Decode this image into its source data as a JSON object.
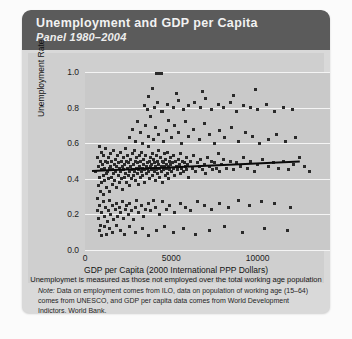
{
  "card": {
    "title": "Unemployment and GDP per Capita",
    "subtitle": "Panel 1980–2004",
    "header_color": "#5b5b5b",
    "panel_color": "#cfcfcf"
  },
  "footnote": {
    "lead": "Note:",
    "text": " Data on employment comes from ILO, data on population of working age (15–64) comes from UNESCO, and GDP per capita data comes from World Development Indictors, World Bank."
  },
  "chart_data": {
    "type": "scatter",
    "title": "Unemployment and GDP per Capita",
    "subtitle": "Panel 1980–2004",
    "xlabel": "GDP per Capita (2000 International  PPP Dollars)",
    "xnote": "Unemploymet is measured as those not employed over the total working age population",
    "ylabel": "Unemployment Rate",
    "xlim": [
      0,
      15000
    ],
    "ylim": [
      0.0,
      1.0
    ],
    "xticks": [
      0,
      5000,
      10000,
      15000
    ],
    "xtick_labels": [
      "0",
      "5000",
      "10000",
      "15000"
    ],
    "yticks": [
      0.0,
      0.2,
      0.4,
      0.6,
      0.8,
      1.0
    ],
    "ytick_labels": [
      "0.0",
      "0.2",
      "0.4",
      "0.6",
      "0.8",
      "1.0"
    ],
    "grid": "horizontal",
    "legend": "none",
    "marker_color": "#2a2a2a",
    "fit_line": {
      "color": "#0b0b0b",
      "x": [
        380,
        12400
      ],
      "y": [
        0.452,
        0.505
      ]
    },
    "points": [
      [
        620,
        0.44
      ],
      [
        700,
        0.29
      ],
      [
        740,
        0.52
      ],
      [
        780,
        0.36
      ],
      [
        800,
        0.47
      ],
      [
        820,
        0.58
      ],
      [
        860,
        0.41
      ],
      [
        880,
        0.33
      ],
      [
        900,
        0.5
      ],
      [
        930,
        0.45
      ],
      [
        960,
        0.38
      ],
      [
        980,
        0.55
      ],
      [
        1010,
        0.48
      ],
      [
        1040,
        0.42
      ],
      [
        1060,
        0.31
      ],
      [
        1090,
        0.53
      ],
      [
        1120,
        0.46
      ],
      [
        1150,
        0.39
      ],
      [
        1180,
        0.5
      ],
      [
        1200,
        0.57
      ],
      [
        1230,
        0.43
      ],
      [
        1260,
        0.35
      ],
      [
        1290,
        0.49
      ],
      [
        1310,
        0.44
      ],
      [
        1340,
        0.52
      ],
      [
        1370,
        0.4
      ],
      [
        1400,
        0.46
      ],
      [
        1430,
        0.33
      ],
      [
        1460,
        0.54
      ],
      [
        1490,
        0.47
      ],
      [
        1520,
        0.41
      ],
      [
        1550,
        0.5
      ],
      [
        1580,
        0.37
      ],
      [
        1610,
        0.45
      ],
      [
        1640,
        0.56
      ],
      [
        1670,
        0.43
      ],
      [
        1700,
        0.48
      ],
      [
        1730,
        0.39
      ],
      [
        1760,
        0.51
      ],
      [
        1790,
        0.44
      ],
      [
        1820,
        0.35
      ],
      [
        1850,
        0.47
      ],
      [
        1880,
        0.53
      ],
      [
        1910,
        0.42
      ],
      [
        1940,
        0.49
      ],
      [
        1970,
        0.38
      ],
      [
        2000,
        0.46
      ],
      [
        2030,
        0.55
      ],
      [
        2060,
        0.44
      ],
      [
        2090,
        0.4
      ],
      [
        2120,
        0.5
      ],
      [
        2150,
        0.47
      ],
      [
        2180,
        0.34
      ],
      [
        2210,
        0.52
      ],
      [
        2240,
        0.45
      ],
      [
        2270,
        0.41
      ],
      [
        2300,
        0.48
      ],
      [
        2330,
        0.57
      ],
      [
        2360,
        0.43
      ],
      [
        2390,
        0.5
      ],
      [
        2420,
        0.38
      ],
      [
        2450,
        0.46
      ],
      [
        2480,
        0.53
      ],
      [
        2510,
        0.42
      ],
      [
        2540,
        0.49
      ],
      [
        2570,
        0.44
      ],
      [
        2600,
        0.36
      ],
      [
        2630,
        0.51
      ],
      [
        2660,
        0.47
      ],
      [
        2690,
        0.4
      ],
      [
        2720,
        0.54
      ],
      [
        2750,
        0.45
      ],
      [
        2780,
        0.48
      ],
      [
        2810,
        0.42
      ],
      [
        2840,
        0.56
      ],
      [
        2870,
        0.44
      ],
      [
        2900,
        0.5
      ],
      [
        2930,
        0.39
      ],
      [
        2960,
        0.46
      ],
      [
        2990,
        0.52
      ],
      [
        3020,
        0.43
      ],
      [
        3050,
        0.49
      ],
      [
        3080,
        0.45
      ],
      [
        3110,
        0.37
      ],
      [
        3140,
        0.53
      ],
      [
        3170,
        0.47
      ],
      [
        3200,
        0.41
      ],
      [
        3230,
        0.5
      ],
      [
        3260,
        0.44
      ],
      [
        3290,
        0.55
      ],
      [
        3320,
        0.46
      ],
      [
        3350,
        0.42
      ],
      [
        3380,
        0.48
      ],
      [
        3410,
        0.51
      ],
      [
        3440,
        0.45
      ],
      [
        3470,
        0.38
      ],
      [
        3500,
        0.53
      ],
      [
        3530,
        0.47
      ],
      [
        3560,
        0.43
      ],
      [
        3590,
        0.49
      ],
      [
        3620,
        0.46
      ],
      [
        3650,
        0.58
      ],
      [
        3680,
        0.44
      ],
      [
        3710,
        0.5
      ],
      [
        3740,
        0.4
      ],
      [
        3770,
        0.47
      ],
      [
        3800,
        0.52
      ],
      [
        3830,
        0.45
      ],
      [
        3860,
        0.48
      ],
      [
        3890,
        0.42
      ],
      [
        3920,
        0.54
      ],
      [
        3950,
        0.46
      ],
      [
        3980,
        0.51
      ],
      [
        4010,
        0.44
      ],
      [
        4040,
        0.49
      ],
      [
        4070,
        0.39
      ],
      [
        4100,
        0.47
      ],
      [
        4130,
        0.53
      ],
      [
        4160,
        0.45
      ],
      [
        4190,
        0.5
      ],
      [
        4220,
        0.43
      ],
      [
        4250,
        0.48
      ],
      [
        4280,
        0.56
      ],
      [
        4310,
        0.46
      ],
      [
        4340,
        0.41
      ],
      [
        4370,
        0.52
      ],
      [
        4400,
        0.47
      ],
      [
        4430,
        0.44
      ],
      [
        4460,
        0.5
      ],
      [
        4490,
        0.38
      ],
      [
        4520,
        0.49
      ],
      [
        4550,
        0.45
      ],
      [
        4580,
        0.54
      ],
      [
        4610,
        0.47
      ],
      [
        4640,
        0.42
      ],
      [
        4670,
        0.51
      ],
      [
        4700,
        0.46
      ],
      [
        4730,
        0.48
      ],
      [
        4760,
        0.43
      ],
      [
        4790,
        0.55
      ],
      [
        4820,
        0.47
      ],
      [
        4850,
        0.4
      ],
      [
        4880,
        0.5
      ],
      [
        4910,
        0.45
      ],
      [
        4940,
        0.52
      ],
      [
        4970,
        0.48
      ],
      [
        5000,
        0.44
      ],
      [
        5050,
        0.49
      ],
      [
        5100,
        0.46
      ],
      [
        5150,
        0.53
      ],
      [
        5200,
        0.42
      ],
      [
        5250,
        0.5
      ],
      [
        5300,
        0.47
      ],
      [
        5350,
        0.45
      ],
      [
        5400,
        0.51
      ],
      [
        5450,
        0.48
      ],
      [
        5500,
        0.43
      ],
      [
        5550,
        0.54
      ],
      [
        5600,
        0.46
      ],
      [
        5650,
        0.5
      ],
      [
        5700,
        0.44
      ],
      [
        5750,
        0.49
      ],
      [
        5800,
        0.47
      ],
      [
        5850,
        0.52
      ],
      [
        5900,
        0.45
      ],
      [
        5950,
        0.48
      ],
      [
        6000,
        0.41
      ],
      [
        6100,
        0.5
      ],
      [
        6200,
        0.46
      ],
      [
        6300,
        0.53
      ],
      [
        6400,
        0.44
      ],
      [
        6500,
        0.49
      ],
      [
        6600,
        0.47
      ],
      [
        6700,
        0.51
      ],
      [
        6800,
        0.45
      ],
      [
        6900,
        0.48
      ],
      [
        7000,
        0.43
      ],
      [
        7100,
        0.52
      ],
      [
        7200,
        0.47
      ],
      [
        7300,
        0.5
      ],
      [
        7400,
        0.45
      ],
      [
        7500,
        0.49
      ],
      [
        7600,
        0.46
      ],
      [
        7700,
        0.54
      ],
      [
        7800,
        0.44
      ],
      [
        7900,
        0.48
      ],
      [
        8000,
        0.51
      ],
      [
        8200,
        0.46
      ],
      [
        8400,
        0.5
      ],
      [
        8600,
        0.45
      ],
      [
        8800,
        0.49
      ],
      [
        9000,
        0.47
      ],
      [
        9200,
        0.52
      ],
      [
        9400,
        0.46
      ],
      [
        9600,
        0.5
      ],
      [
        9800,
        0.44
      ],
      [
        10000,
        0.48
      ],
      [
        10300,
        0.51
      ],
      [
        10600,
        0.47
      ],
      [
        10900,
        0.49
      ],
      [
        11200,
        0.46
      ],
      [
        11500,
        0.5
      ],
      [
        11800,
        0.45
      ],
      [
        12100,
        0.48
      ],
      [
        12400,
        0.52
      ],
      [
        12700,
        0.47
      ],
      [
        13000,
        0.44
      ],
      [
        700,
        0.22
      ],
      [
        760,
        0.18
      ],
      [
        820,
        0.25
      ],
      [
        900,
        0.14
      ],
      [
        980,
        0.21
      ],
      [
        1050,
        0.27
      ],
      [
        1120,
        0.19
      ],
      [
        1200,
        0.24
      ],
      [
        1280,
        0.16
      ],
      [
        1350,
        0.22
      ],
      [
        1430,
        0.28
      ],
      [
        1500,
        0.2
      ],
      [
        1580,
        0.25
      ],
      [
        1660,
        0.17
      ],
      [
        1740,
        0.23
      ],
      [
        1820,
        0.26
      ],
      [
        1900,
        0.19
      ],
      [
        1980,
        0.24
      ],
      [
        2060,
        0.21
      ],
      [
        2150,
        0.27
      ],
      [
        2230,
        0.18
      ],
      [
        2320,
        0.23
      ],
      [
        2400,
        0.25
      ],
      [
        2500,
        0.2
      ],
      [
        2600,
        0.26
      ],
      [
        2700,
        0.22
      ],
      [
        2800,
        0.17
      ],
      [
        2900,
        0.24
      ],
      [
        3000,
        0.28
      ],
      [
        3120,
        0.21
      ],
      [
        3250,
        0.25
      ],
      [
        3380,
        0.19
      ],
      [
        3500,
        0.23
      ],
      [
        3650,
        0.26
      ],
      [
        3800,
        0.22
      ],
      [
        3950,
        0.28
      ],
      [
        4100,
        0.24
      ],
      [
        4300,
        0.2
      ],
      [
        4500,
        0.27
      ],
      [
        4700,
        0.23
      ],
      [
        4900,
        0.25
      ],
      [
        5200,
        0.21
      ],
      [
        5500,
        0.26
      ],
      [
        5800,
        0.24
      ],
      [
        6100,
        0.22
      ],
      [
        6500,
        0.27
      ],
      [
        6900,
        0.25
      ],
      [
        7300,
        0.23
      ],
      [
        7800,
        0.26
      ],
      [
        8300,
        0.24
      ],
      [
        8900,
        0.28
      ],
      [
        9500,
        0.25
      ],
      [
        10200,
        0.27
      ],
      [
        11000,
        0.26
      ],
      [
        11900,
        0.24
      ],
      [
        820,
        0.11
      ],
      [
        960,
        0.08
      ],
      [
        1100,
        0.13
      ],
      [
        1260,
        0.09
      ],
      [
        1420,
        0.12
      ],
      [
        1600,
        0.1
      ],
      [
        1800,
        0.14
      ],
      [
        2050,
        0.11
      ],
      [
        2300,
        0.09
      ],
      [
        2600,
        0.13
      ],
      [
        2950,
        0.1
      ],
      [
        3300,
        0.12
      ],
      [
        3700,
        0.08
      ],
      [
        4150,
        0.11
      ],
      [
        4600,
        0.13
      ],
      [
        5100,
        0.1
      ],
      [
        5700,
        0.12
      ],
      [
        6400,
        0.09
      ],
      [
        7200,
        0.11
      ],
      [
        8100,
        0.13
      ],
      [
        9100,
        0.1
      ],
      [
        10400,
        0.12
      ],
      [
        11700,
        0.11
      ],
      [
        2600,
        0.63
      ],
      [
        2750,
        0.68
      ],
      [
        2900,
        0.61
      ],
      [
        3050,
        0.72
      ],
      [
        3200,
        0.66
      ],
      [
        3350,
        0.6
      ],
      [
        3500,
        0.7
      ],
      [
        3650,
        0.64
      ],
      [
        3800,
        0.75
      ],
      [
        3950,
        0.62
      ],
      [
        4100,
        0.69
      ],
      [
        4250,
        0.65
      ],
      [
        4400,
        0.78
      ],
      [
        4550,
        0.61
      ],
      [
        4700,
        0.67
      ],
      [
        4850,
        0.73
      ],
      [
        5000,
        0.63
      ],
      [
        5200,
        0.7
      ],
      [
        5400,
        0.66
      ],
      [
        5600,
        0.6
      ],
      [
        5800,
        0.72
      ],
      [
        6000,
        0.64
      ],
      [
        6300,
        0.68
      ],
      [
        6600,
        0.62
      ],
      [
        6900,
        0.71
      ],
      [
        7200,
        0.65
      ],
      [
        7500,
        0.6
      ],
      [
        7800,
        0.67
      ],
      [
        8100,
        0.63
      ],
      [
        8500,
        0.69
      ],
      [
        8900,
        0.61
      ],
      [
        9300,
        0.66
      ],
      [
        9700,
        0.64
      ],
      [
        10100,
        0.6
      ],
      [
        10600,
        0.62
      ],
      [
        11100,
        0.65
      ],
      [
        11600,
        0.61
      ],
      [
        12200,
        0.63
      ],
      [
        3450,
        0.81
      ],
      [
        3600,
        0.79
      ],
      [
        3700,
        0.86
      ],
      [
        4000,
        0.8
      ],
      [
        4200,
        0.83
      ],
      [
        4500,
        0.78
      ],
      [
        4800,
        0.82
      ],
      [
        5100,
        0.8
      ],
      [
        5400,
        0.84
      ],
      [
        5700,
        0.79
      ],
      [
        6000,
        0.81
      ],
      [
        6350,
        0.83
      ],
      [
        6700,
        0.8
      ],
      [
        7000,
        0.85
      ],
      [
        7350,
        0.79
      ],
      [
        7700,
        0.82
      ],
      [
        8000,
        0.8
      ],
      [
        8400,
        0.83
      ],
      [
        8800,
        0.78
      ],
      [
        9200,
        0.81
      ],
      [
        9600,
        0.8
      ],
      [
        10000,
        0.79
      ],
      [
        10500,
        0.82
      ],
      [
        11000,
        0.78
      ],
      [
        11500,
        0.8
      ],
      [
        12000,
        0.79
      ],
      [
        4150,
        0.99
      ],
      [
        4300,
        0.99
      ],
      [
        4450,
        0.99
      ],
      [
        3900,
        0.91
      ],
      [
        5300,
        0.88
      ],
      [
        6800,
        0.89
      ],
      [
        8600,
        0.87
      ],
      [
        9900,
        0.9
      ]
    ]
  }
}
